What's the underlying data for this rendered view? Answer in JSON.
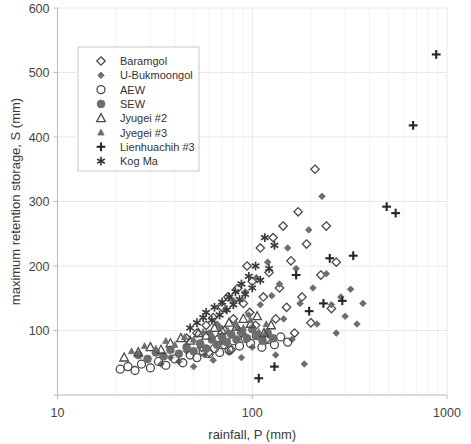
{
  "chart_data": {
    "type": "scatter",
    "title": "",
    "xlabel": "rainfall,  P (mm)",
    "ylabel": "maximum retention storage, S (mm)",
    "xscale": "log",
    "yscale": "linear",
    "xlim": [
      10,
      1000
    ],
    "ylim": [
      0,
      600
    ],
    "xticks": [
      10,
      100,
      1000
    ],
    "xtick_labels": [
      "10",
      "100",
      "1000"
    ],
    "yticks": [
      0,
      100,
      200,
      300,
      400,
      500,
      600
    ],
    "ytick_labels": [
      "",
      "100",
      "200",
      "300",
      "400",
      "500",
      "600"
    ],
    "grid": "minor-log-vertical-and-horizontal",
    "legend_position": "upper-left-inside",
    "series": [
      {
        "name": "Baramgol",
        "marker": "open-diamond",
        "color": "#4a4a4a",
        "points": [
          [
            46,
            88
          ],
          [
            52,
            96
          ],
          [
            55,
            74
          ],
          [
            58,
            108
          ],
          [
            60,
            66
          ],
          [
            63,
            120
          ],
          [
            66,
            86
          ],
          [
            70,
            136
          ],
          [
            72,
            100
          ],
          [
            75,
            152
          ],
          [
            78,
            70
          ],
          [
            80,
            118
          ],
          [
            84,
            165
          ],
          [
            88,
            96
          ],
          [
            90,
            142
          ],
          [
            94,
            200
          ],
          [
            97,
            128
          ],
          [
            100,
            176
          ],
          [
            104,
            108
          ],
          [
            110,
            228
          ],
          [
            114,
            152
          ],
          [
            118,
            86
          ],
          [
            122,
            190
          ],
          [
            128,
            244
          ],
          [
            132,
            118
          ],
          [
            138,
            166
          ],
          [
            144,
            262
          ],
          [
            150,
            136
          ],
          [
            158,
            208
          ],
          [
            165,
            96
          ],
          [
            172,
            284
          ],
          [
            180,
            152
          ],
          [
            190,
            234
          ],
          [
            200,
            112
          ],
          [
            210,
            350
          ],
          [
            225,
            186
          ],
          [
            240,
            262
          ],
          [
            255,
            134
          ],
          [
            270,
            206
          ]
        ]
      },
      {
        "name": "U-Bukmoongol",
        "marker": "filled-diamond",
        "color": "#6d6d6d",
        "points": [
          [
            34,
            48
          ],
          [
            38,
            58
          ],
          [
            42,
            52
          ],
          [
            46,
            68
          ],
          [
            50,
            44
          ],
          [
            54,
            78
          ],
          [
            57,
            62
          ],
          [
            60,
            96
          ],
          [
            63,
            54
          ],
          [
            66,
            110
          ],
          [
            70,
            82
          ],
          [
            73,
            132
          ],
          [
            76,
            66
          ],
          [
            80,
            146
          ],
          [
            84,
            104
          ],
          [
            88,
            58
          ],
          [
            92,
            160
          ],
          [
            96,
            124
          ],
          [
            100,
            74
          ],
          [
            105,
            182
          ],
          [
            110,
            140
          ],
          [
            115,
            92
          ],
          [
            120,
            206
          ],
          [
            126,
            154
          ],
          [
            132,
            62
          ],
          [
            138,
            172
          ],
          [
            145,
            118
          ],
          [
            152,
            228
          ],
          [
            160,
            86
          ],
          [
            168,
            196
          ],
          [
            176,
            142
          ],
          [
            185,
            48
          ],
          [
            195,
            256
          ],
          [
            205,
            166
          ],
          [
            215,
            110
          ],
          [
            228,
            308
          ],
          [
            240,
            188
          ],
          [
            255,
            140
          ],
          [
            270,
            96
          ],
          [
            285,
            152
          ],
          [
            300,
            122
          ],
          [
            320,
            164
          ],
          [
            345,
            110
          ],
          [
            370,
            142
          ]
        ]
      },
      {
        "name": "AEW",
        "marker": "open-circle",
        "color": "#4a4a4a",
        "points": [
          [
            21,
            40
          ],
          [
            23,
            44
          ],
          [
            25,
            38
          ],
          [
            27,
            48
          ],
          [
            30,
            42
          ],
          [
            33,
            52
          ],
          [
            36,
            46
          ],
          [
            40,
            56
          ],
          [
            44,
            50
          ],
          [
            48,
            62
          ],
          [
            52,
            58
          ],
          [
            56,
            68
          ],
          [
            60,
            64
          ],
          [
            64,
            72
          ],
          [
            68,
            66
          ],
          [
            72,
            78
          ],
          [
            76,
            70
          ],
          [
            80,
            84
          ],
          [
            86,
            76
          ],
          [
            92,
            88
          ],
          [
            98,
            80
          ],
          [
            105,
            92
          ],
          [
            112,
            74
          ],
          [
            120,
            86
          ],
          [
            130,
            78
          ],
          [
            140,
            90
          ],
          [
            152,
            82
          ]
        ]
      },
      {
        "name": "SEW",
        "marker": "filled-circle",
        "color": "#6d6d6d",
        "points": [
          [
            26,
            62
          ],
          [
            29,
            56
          ],
          [
            32,
            66
          ],
          [
            35,
            60
          ],
          [
            38,
            70
          ],
          [
            42,
            64
          ],
          [
            46,
            74
          ],
          [
            50,
            68
          ],
          [
            54,
            80
          ],
          [
            58,
            72
          ],
          [
            62,
            86
          ],
          [
            66,
            78
          ],
          [
            70,
            90
          ],
          [
            74,
            82
          ],
          [
            78,
            94
          ],
          [
            83,
            86
          ],
          [
            88,
            98
          ],
          [
            94,
            88
          ],
          [
            100,
            102
          ],
          [
            106,
            92
          ],
          [
            113,
            84
          ],
          [
            120,
            96
          ],
          [
            128,
            88
          ]
        ]
      },
      {
        "name": "Jyugei #2",
        "marker": "open-triangle",
        "color": "#4a4a4a",
        "points": [
          [
            22,
            58
          ],
          [
            26,
            66
          ],
          [
            30,
            74
          ],
          [
            34,
            70
          ],
          [
            38,
            80
          ],
          [
            43,
            88
          ],
          [
            48,
            84
          ],
          [
            53,
            96
          ],
          [
            58,
            92
          ],
          [
            64,
            104
          ],
          [
            70,
            100
          ],
          [
            76,
            112
          ],
          [
            83,
            106
          ],
          [
            90,
            118
          ],
          [
            98,
            110
          ],
          [
            106,
            122
          ],
          [
            115,
            96
          ],
          [
            125,
            108
          ]
        ]
      },
      {
        "name": "Jyegei #3",
        "marker": "filled-triangle",
        "color": "#6d6d6d",
        "points": [
          [
            24,
            68
          ],
          [
            28,
            76
          ],
          [
            32,
            72
          ],
          [
            36,
            84
          ],
          [
            40,
            78
          ],
          [
            45,
            90
          ],
          [
            50,
            86
          ],
          [
            56,
            98
          ],
          [
            62,
            94
          ],
          [
            68,
            106
          ],
          [
            75,
            100
          ],
          [
            82,
            112
          ],
          [
            90,
            104
          ],
          [
            98,
            116
          ],
          [
            108,
            98
          ],
          [
            118,
            110
          ]
        ]
      },
      {
        "name": "Lienhuachih #3",
        "marker": "plus",
        "color": "#262626",
        "points": [
          [
            108,
            26
          ],
          [
            130,
            44
          ],
          [
            168,
            186
          ],
          [
            196,
            130
          ],
          [
            232,
            142
          ],
          [
            250,
            212
          ],
          [
            290,
            146
          ],
          [
            330,
            216
          ],
          [
            490,
            292
          ],
          [
            545,
            282
          ],
          [
            670,
            418
          ],
          [
            880,
            528
          ]
        ]
      },
      {
        "name": "Kog Ma",
        "marker": "asterisk",
        "color": "#3a3a3a",
        "points": [
          [
            48,
            104
          ],
          [
            52,
            112
          ],
          [
            56,
            120
          ],
          [
            58,
            128
          ],
          [
            62,
            116
          ],
          [
            64,
            136
          ],
          [
            68,
            124
          ],
          [
            70,
            144
          ],
          [
            74,
            132
          ],
          [
            76,
            152
          ],
          [
            80,
            140
          ],
          [
            82,
            160
          ],
          [
            86,
            148
          ],
          [
            88,
            172
          ],
          [
            92,
            156
          ],
          [
            96,
            184
          ],
          [
            100,
            166
          ],
          [
            104,
            200
          ],
          [
            110,
            178
          ],
          [
            116,
            244
          ],
          [
            122,
            196
          ],
          [
            130,
            232
          ]
        ]
      }
    ]
  },
  "legend": {
    "items": [
      {
        "label": "Baramgol",
        "marker": "open-diamond"
      },
      {
        "label": "U-Bukmoongol",
        "marker": "filled-diamond"
      },
      {
        "label": "AEW",
        "marker": "open-circle"
      },
      {
        "label": "SEW",
        "marker": "filled-circle"
      },
      {
        "label": "Jyugei #2",
        "marker": "open-triangle"
      },
      {
        "label": "Jyegei #3",
        "marker": "filled-triangle"
      },
      {
        "label": "Lienhuachih #3",
        "marker": "plus"
      },
      {
        "label": "Kog Ma",
        "marker": "asterisk"
      }
    ]
  },
  "colors": {
    "background": "#ffffff",
    "grid": "#e8e8e8",
    "axis": "#b8b8b8",
    "text": "#3a3a3a",
    "marker_dark": "#4a4a4a",
    "marker_mid": "#6d6d6d",
    "marker_black": "#262626"
  }
}
